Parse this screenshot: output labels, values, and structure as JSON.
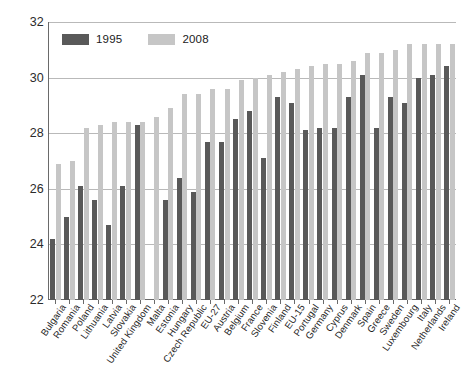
{
  "chart_data": {
    "type": "bar",
    "title": "",
    "subtitle": "",
    "xlabel": "",
    "ylabel": "",
    "ylim": [
      22,
      32
    ],
    "ytick_labels": [
      "22",
      "24",
      "26",
      "28",
      "30",
      "32"
    ],
    "yticks": [
      22,
      24,
      26,
      28,
      30,
      32
    ],
    "grid": true,
    "legend_position": "top-left",
    "categories": [
      "Bulgaria",
      "Romania",
      "Poland",
      "Lithuania",
      "Latvia",
      "Slovakia",
      "United Kingdom",
      "Malta",
      "Estonia",
      "Hungary",
      "Czech Republic",
      "EU-27",
      "Austria",
      "Belgium",
      "France",
      "Slovenia",
      "Finland",
      "EU-15",
      "Portugal",
      "Germany",
      "Cyprus",
      "Denmark",
      "Spain",
      "Greece",
      "Sweden",
      "Luxembourg",
      "Italy",
      "Netherlands",
      "Ireland"
    ],
    "series": [
      {
        "name": "1995",
        "color": "#595959",
        "values": [
          24.2,
          25.0,
          26.1,
          25.6,
          24.7,
          26.1,
          28.3,
          null,
          25.6,
          26.4,
          25.9,
          27.7,
          27.7,
          28.5,
          28.8,
          27.1,
          29.3,
          29.1,
          28.1,
          28.2,
          28.2,
          29.3,
          30.1,
          28.2,
          29.3,
          29.1,
          30.0,
          30.1,
          30.4
        ]
      },
      {
        "name": "2008",
        "color": "#c6c6c6",
        "values": [
          26.9,
          27.0,
          28.2,
          28.3,
          28.4,
          28.4,
          28.4,
          28.6,
          28.9,
          29.4,
          29.4,
          29.6,
          29.6,
          29.9,
          30.0,
          30.1,
          30.2,
          30.3,
          30.4,
          30.5,
          30.5,
          30.6,
          30.9,
          30.9,
          31.0,
          31.2,
          31.2,
          31.2,
          31.2
        ]
      }
    ],
    "legend": [
      {
        "label": "1995",
        "color": "#595959"
      },
      {
        "label": "2008",
        "color": "#c6c6c6"
      }
    ]
  }
}
